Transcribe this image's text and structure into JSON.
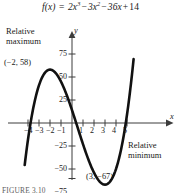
{
  "figure": {
    "equation": {
      "lhs": "f(x)",
      "equals": "=",
      "term1_coeff": "2x",
      "term1_exp": "3",
      "op1": "−",
      "term2_coeff": "3x",
      "term2_exp": "2",
      "op2": "−",
      "term3": "36x",
      "op3": "+",
      "term4": "14",
      "full_text": "f(x) = 2x³ − 3x² − 36x + 14"
    },
    "caption": "FIGURE 3.10",
    "annotations": {
      "relative_maximum_line1": "Relative",
      "relative_maximum_line2": "maximum",
      "relative_minimum_line1": "Relative",
      "relative_minimum_line2": "minimum",
      "max_point": "(−2, 58)",
      "min_point": "(3, −67)"
    },
    "axes": {
      "x_name": "x",
      "y_name": "y",
      "x_tick_labels": [
        "−4",
        "−3",
        "−2",
        "−1",
        "1",
        "2",
        "3",
        "4",
        "5"
      ],
      "y_tick_labels": [
        "75",
        "50",
        "25",
        "−25",
        "−50",
        "−75"
      ]
    },
    "colors": {
      "curve": "#111111",
      "axis": "#444444",
      "text": "#1a1a1a",
      "background": "#ffffff"
    }
  },
  "chart_data": {
    "type": "line",
    "xlabel": "x",
    "ylabel": "y",
    "xlim": [
      -4.3,
      5.6
    ],
    "ylim": [
      -88,
      92
    ],
    "grid": false,
    "legend": "none",
    "x_ticks": [
      -4,
      -3,
      -2,
      -1,
      1,
      2,
      3,
      4,
      5
    ],
    "y_ticks": [
      75,
      50,
      25,
      -25,
      -50,
      -75
    ],
    "series": [
      {
        "name": "f(x) = 2x^3 - 3x^2 - 36x + 14",
        "x": [
          -4.3,
          -4.0,
          -3.5,
          -3.0,
          -2.5,
          -2.0,
          -1.5,
          -1.0,
          -0.5,
          0.0,
          0.5,
          1.0,
          1.5,
          2.0,
          2.5,
          3.0,
          3.5,
          4.0,
          4.5,
          5.0,
          5.3
        ],
        "y": [
          -45.3,
          -18.0,
          36.5,
          41.0,
          54.0,
          58.0,
          54.5,
          43.0,
          31.0,
          14.0,
          -4.5,
          -23.0,
          -40.0,
          -54.0,
          -63.5,
          -67.0,
          -63.5,
          -50.0,
          -25.0,
          9.0,
          36.6
        ]
      }
    ],
    "annotations": [
      {
        "label": "Relative maximum",
        "point_label": "(−2, 58)",
        "x": -2,
        "y": 58
      },
      {
        "label": "Relative minimum",
        "point_label": "(3, −67)",
        "x": 3,
        "y": -67
      }
    ]
  }
}
